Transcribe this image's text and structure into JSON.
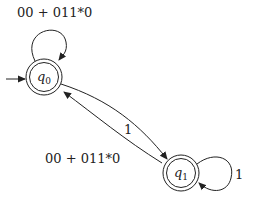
{
  "diagram": {
    "type": "finite-automaton",
    "states": [
      {
        "id": "q0",
        "label": "q",
        "sub": "0",
        "initial": true,
        "accepting": true,
        "cx": 44,
        "cy": 77
      },
      {
        "id": "q1",
        "label": "q",
        "sub": "1",
        "initial": false,
        "accepting": true,
        "cx": 181,
        "cy": 173
      }
    ],
    "transitions": [
      {
        "from": "q0",
        "to": "q0",
        "label": "00 + 011*0"
      },
      {
        "from": "q0",
        "to": "q1",
        "label": "1"
      },
      {
        "from": "q1",
        "to": "q0",
        "label": "00 + 011*0"
      },
      {
        "from": "q1",
        "to": "q1",
        "label": "1"
      }
    ],
    "colors": {
      "stroke": "#222222",
      "background": "#ffffff"
    }
  }
}
